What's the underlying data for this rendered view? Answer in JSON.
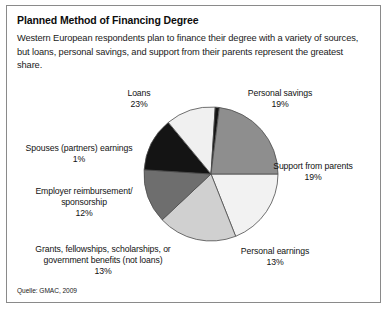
{
  "figure": {
    "title": "Planned Method of Financing Degree",
    "subtitle": "Western European respondents plan to finance their degree with a variety of sources, but loans, personal savings, and support from their parents represent the greatest share.",
    "source": "Quelle: GMAC, 2009",
    "border_color": "#8a8a8a",
    "background_color": "#ffffff"
  },
  "labels": {
    "loans": "Loans\n23%",
    "personal_savings": "Personal savings\n19%",
    "support_from_parents": "Support from parents\n19%",
    "personal_earnings": "Personal earnings\n13%",
    "grants": "Grants, fellowships, scholarships, or\ngovernment benefits (not loans)\n13%",
    "employer": "Employer reimbursement/\nsponsorship\n12%",
    "spouses": "Spouses (partners) earnings\n1%"
  },
  "chart_data": {
    "type": "pie",
    "title": "Planned Method of Financing Degree",
    "xlabel": "",
    "ylabel": "",
    "legend": "none",
    "grid": false,
    "units": "percent",
    "start_angle_deg": 0,
    "direction": "clockwise",
    "center": [
      204,
      168
    ],
    "radius": 67,
    "categories": [
      "Personal savings",
      "Support from parents",
      "Personal earnings",
      "Grants, fellowships, scholarships, or government benefits (not loans)",
      "Employer reimbursement/sponsorship",
      "Spouses (partners) earnings",
      "Loans"
    ],
    "values": [
      19,
      19,
      13,
      13,
      12,
      1,
      23
    ],
    "colors": [
      "#f2f2f2",
      "#d0d0d0",
      "#6e6e6e",
      "#141414",
      "#f0f0f0",
      "#141414",
      "#8e8e8e"
    ],
    "slice_border_color": "#4d4d4d",
    "slices": [
      {
        "label": "Personal savings",
        "value": 19,
        "display": "19%",
        "color": "#f2f2f2"
      },
      {
        "label": "Support from parents",
        "value": 19,
        "display": "19%",
        "color": "#d0d0d0"
      },
      {
        "label": "Personal earnings",
        "value": 13,
        "display": "13%",
        "color": "#6e6e6e"
      },
      {
        "label": "Grants, fellowships, scholarships, or government benefits (not loans)",
        "value": 13,
        "display": "13%",
        "color": "#141414"
      },
      {
        "label": "Employer reimbursement/sponsorship",
        "value": 12,
        "display": "12%",
        "color": "#f0f0f0"
      },
      {
        "label": "Spouses (partners) earnings",
        "value": 1,
        "display": "1%",
        "color": "#141414"
      },
      {
        "label": "Loans",
        "value": 23,
        "display": "23%",
        "color": "#8e8e8e"
      }
    ]
  }
}
